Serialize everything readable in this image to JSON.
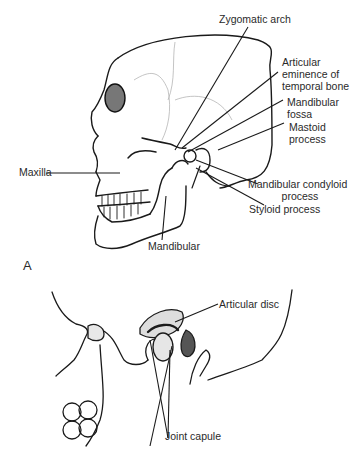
{
  "figure": {
    "panel_a_label": "A",
    "panel_b_labels": {
      "articular_disc": "Articular disc",
      "joint_capsule": "Joint capule"
    },
    "skull_labels": {
      "zygomatic_arch": "Zygomatic arch",
      "articular_eminence_1": "Articular",
      "articular_eminence_2": "eminence of",
      "articular_eminence_3": "temporal bone",
      "mandibular_fossa_1": "Mandibular",
      "mandibular_fossa_2": "fossa",
      "mastoid_1": "Mastoid",
      "mastoid_2": "process",
      "condyloid_1": "Mandibular condyloid",
      "condyloid_2": "process",
      "styloid": "Styloid process",
      "maxilla": "Maxilla",
      "mandibular": "Mandibular"
    }
  }
}
